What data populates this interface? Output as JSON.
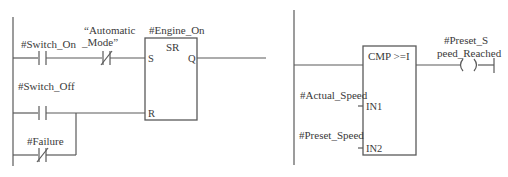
{
  "network_left": {
    "title": "SR flip-flop network",
    "contacts": [
      {
        "tag": "#Switch_On",
        "type": "normally-open"
      },
      {
        "tag_line1": "“Automatic",
        "tag_line2": "_Mode”",
        "type": "normally-closed"
      },
      {
        "tag": "#Switch_Off",
        "type": "normally-open"
      },
      {
        "tag": "#Failure",
        "type": "normally-closed"
      }
    ],
    "block": {
      "instance": "#Engine_On",
      "type": "SR",
      "pins": {
        "set": "S",
        "reset": "R",
        "output": "Q"
      }
    }
  },
  "network_right": {
    "title": "Compare network",
    "block": {
      "type": "CMP >=I",
      "pins": {
        "in1": "IN1",
        "in2": "IN2"
      },
      "in1_tag": "#Actual_Speed",
      "in2_tag": "#Preset_Speed"
    },
    "coil": {
      "tag_line1": "#Preset_S",
      "tag_line2": "peed_Reached",
      "symbol": "( )"
    }
  },
  "colors": {
    "line": "#5a5a5a",
    "text": "#3a3a3a",
    "background": "#ffffff"
  }
}
